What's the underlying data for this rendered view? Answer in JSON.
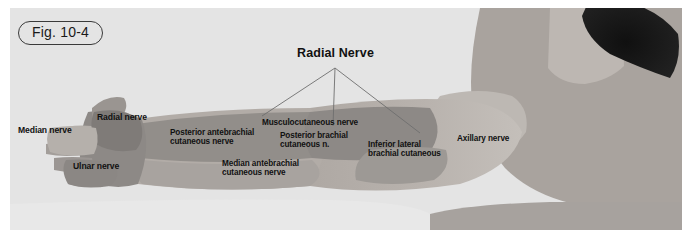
{
  "figure": {
    "badge_label": "Fig. 10-4",
    "title": "Radial Nerve",
    "panel_background": "#e4e4e4",
    "page_background": "#ffffff"
  },
  "palette": {
    "skin_base": "#b9b3ae",
    "skin_light": "#c9c4bf",
    "skin_shadow": "#a39d98",
    "zone_dark": "#8e8a87",
    "zone_mid": "#a6a19d",
    "zone_light": "#c2bdb8",
    "hair_dark": "#181818",
    "leader_line": "#6e6e6e",
    "text": "#111111"
  },
  "labels": [
    {
      "id": "radial-nerve-title",
      "text": "Radial Nerve",
      "x": 297,
      "y": 46,
      "size": "title"
    },
    {
      "id": "radial-nerve-hand",
      "text": "Radial nerve",
      "x": 97,
      "y": 113,
      "size": "mid"
    },
    {
      "id": "median-nerve-hand",
      "text": "Median nerve",
      "x": 18,
      "y": 126,
      "size": "mid"
    },
    {
      "id": "ulnar-nerve-hand",
      "text": "Ulnar nerve",
      "x": 73,
      "y": 162,
      "size": "mid"
    },
    {
      "id": "musculocutaneous-nerve",
      "text": "Musculocutaneous nerve",
      "x": 262,
      "y": 118,
      "size": "small"
    },
    {
      "id": "posterior-antebrachial-cutaneous-nerve",
      "text": "Posterior antebrachial\ncutaneous nerve",
      "x": 170,
      "y": 128,
      "size": "small"
    },
    {
      "id": "posterior-brachial-cutaneous-nerve",
      "text": "Posterior brachial\ncutaneous n.",
      "x": 280,
      "y": 131,
      "size": "small"
    },
    {
      "id": "median-antebrachial-cutaneous-nerve",
      "text": "Median antebrachial\ncutaneous nerve",
      "x": 222,
      "y": 159,
      "size": "small"
    },
    {
      "id": "inferior-lateral-brachial-cutaneous",
      "text": "Inferior lateral\nbrachial cutaneous",
      "x": 368,
      "y": 140,
      "size": "small"
    },
    {
      "id": "axillary-nerve",
      "text": "Axillary nerve",
      "x": 457,
      "y": 134,
      "size": "small"
    }
  ],
  "leader_lines": {
    "origin": {
      "x": 335,
      "y": 68
    },
    "endpoints": [
      {
        "id": "leader-to-musculocutaneous",
        "x": 262,
        "y": 116
      },
      {
        "id": "leader-to-posterior-brachial",
        "x": 333,
        "y": 126
      },
      {
        "id": "leader-to-inferior-lateral",
        "x": 420,
        "y": 133
      }
    ]
  }
}
